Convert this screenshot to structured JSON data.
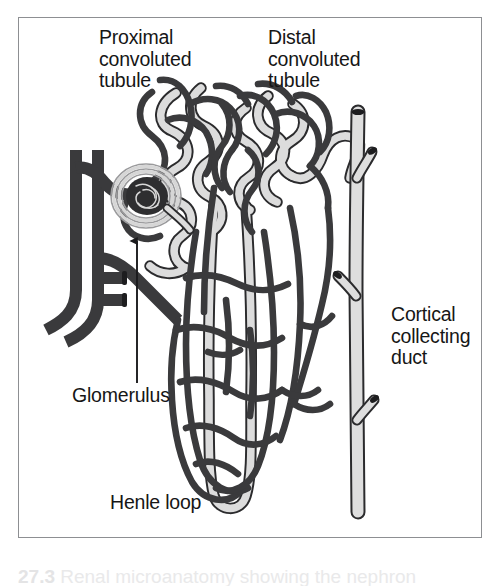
{
  "figure": {
    "kind": "anatomical-diagram",
    "subject": "nephron",
    "frame": {
      "border_color": "#8d8f92",
      "background": "#ffffff"
    },
    "palette": {
      "capillary_dark": "#3a3a3c",
      "tubule_light_fill": "#dcdcdc",
      "tubule_outline": "#2b2b2d",
      "collecting_duct_fill": "#dedede",
      "glomerulus_dark": "#2e2e30",
      "label_text": "#161616",
      "caption_text": "#e9e9ea"
    }
  },
  "labels": {
    "proximal_convoluted_tubule": "Proximal\nconvoluted\ntubule",
    "distal_convoluted_tubule": "Distal\nconvoluted\ntubule",
    "cortical_collecting_duct": "Cortical\ncollecting\nduct",
    "glomerulus": "Glomerulus",
    "henle_loop": "Henle loop"
  },
  "leader": {
    "glomerulus_arrow": {
      "from_x": 137,
      "from_y": 383,
      "to_x": 137,
      "to_y": 238,
      "has_arrowhead": true,
      "arrow_points_to": "glomerulus"
    }
  },
  "caption": {
    "number": "27.3",
    "text": "Renal microanatomy showing the nephron",
    "visible": "cropped-top-of-letters-only"
  }
}
